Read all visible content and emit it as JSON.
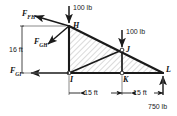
{
  "figure": {
    "type": "truss-free-body-diagram",
    "stroke_color": "#1a1a1a",
    "hatch_color": "#b0b0b0",
    "background_color": "#ffffff"
  },
  "joints": [
    {
      "id": "H",
      "label": "H",
      "x": 69,
      "y": 26
    },
    {
      "id": "I",
      "label": "I",
      "x": 69,
      "y": 73
    },
    {
      "id": "J",
      "label": "J",
      "x": 122,
      "y": 50
    },
    {
      "id": "K",
      "label": "K",
      "x": 122,
      "y": 73
    },
    {
      "id": "L",
      "label": "L",
      "x": 163,
      "y": 73
    }
  ],
  "members": [
    {
      "name": "member-HI",
      "from": "H",
      "to": "I"
    },
    {
      "name": "member-HL",
      "from": "H",
      "to": "L"
    },
    {
      "name": "member-IL",
      "from": "I",
      "to": "L"
    },
    {
      "name": "member-IJ",
      "from": "I",
      "to": "J"
    },
    {
      "name": "member-JK",
      "from": "J",
      "to": "K"
    }
  ],
  "forces": [
    {
      "name": "F_FH",
      "symbol": "F",
      "subscript": "FH",
      "label": "F",
      "direction": "up-left",
      "applied_at": "H"
    },
    {
      "name": "F_GH",
      "symbol": "F",
      "subscript": "GH",
      "label": "F",
      "direction": "down-left",
      "applied_at": "H"
    },
    {
      "name": "F_GI",
      "symbol": "F",
      "subscript": "GI",
      "label": "F",
      "direction": "left",
      "applied_at": "I"
    }
  ],
  "loads": [
    {
      "name": "load-at-H",
      "value": "100 lb",
      "direction": "down",
      "applied_at": "H"
    },
    {
      "name": "load-at-J",
      "value": "100 lb",
      "direction": "down",
      "applied_at": "J"
    },
    {
      "name": "reaction-at-L",
      "value": "750 lb",
      "direction": "up",
      "applied_at": "L"
    }
  ],
  "dimensions": [
    {
      "name": "vertical-height",
      "value": "16 ft",
      "orientation": "vertical",
      "spans": "H to I"
    },
    {
      "name": "span-I-K",
      "value": "15 ft",
      "orientation": "horizontal",
      "spans": "I to K"
    },
    {
      "name": "span-K-L",
      "value": "15 ft",
      "orientation": "horizontal",
      "spans": "K to L"
    }
  ]
}
